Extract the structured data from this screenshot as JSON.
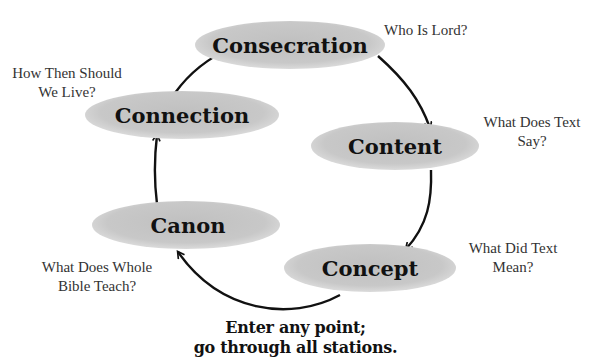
{
  "diagram": {
    "nodes": [
      {
        "id": "consecration",
        "label": "Consecration",
        "question": [
          "Who Is Lord?"
        ]
      },
      {
        "id": "content",
        "label": "Content",
        "question": [
          "What Does Text",
          "Say?"
        ]
      },
      {
        "id": "concept",
        "label": "Concept",
        "question": [
          "What Did Text",
          "Mean?"
        ]
      },
      {
        "id": "canon",
        "label": "Canon",
        "question": [
          "What Does Whole",
          "Bible Teach?"
        ]
      },
      {
        "id": "connection",
        "label": "Connection",
        "question": [
          "How Then Should",
          "We Live?"
        ]
      }
    ],
    "flow": [
      "consecration",
      "content",
      "concept",
      "canon",
      "connection",
      "consecration"
    ],
    "colors": {
      "ellipse_fill": "#c4c4c4",
      "ellipse_edge": "#dcdcdc",
      "arrow": "#111111",
      "text": "#111111",
      "question_text": "#333333"
    }
  },
  "footer": {
    "line1": "Enter any point;",
    "line2": "go through all stations."
  }
}
